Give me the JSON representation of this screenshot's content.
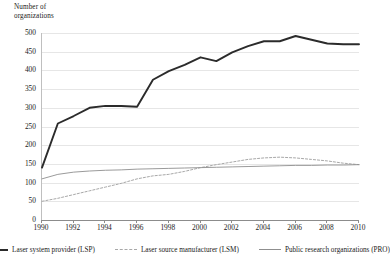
{
  "chart_data": {
    "type": "line",
    "title": "",
    "ylabel": "Number of\norganizations",
    "xlabel": "",
    "ylim": [
      0,
      500
    ],
    "xlim": [
      1990,
      2010
    ],
    "grid": true,
    "legend_position": "bottom",
    "yticks": [
      500,
      450,
      400,
      350,
      300,
      250,
      200,
      150,
      100,
      50,
      0
    ],
    "xticks": [
      1990,
      1992,
      1994,
      1996,
      1998,
      2000,
      2002,
      2004,
      2006,
      2008,
      2010
    ],
    "x": [
      1990,
      1991,
      1992,
      1993,
      1994,
      1995,
      1996,
      1997,
      1998,
      1999,
      2000,
      2001,
      2002,
      2003,
      2004,
      2005,
      2006,
      2007,
      2008,
      2009,
      2010
    ],
    "series": [
      {
        "name": "Laser system provider (LSP)",
        "style": "solid-bold",
        "color": "#2b2b2b",
        "values": [
          140,
          258,
          278,
          300,
          305,
          305,
          303,
          375,
          398,
          415,
          435,
          425,
          448,
          465,
          478,
          478,
          492,
          482,
          472,
          470,
          470
        ]
      },
      {
        "name": "Laser source manufacturer (LSM)",
        "style": "dashed",
        "color": "#a8a8a8",
        "values": [
          50,
          58,
          68,
          78,
          88,
          98,
          110,
          118,
          122,
          130,
          140,
          148,
          155,
          162,
          166,
          168,
          166,
          162,
          158,
          152,
          148
        ]
      },
      {
        "name": "Public research organizations (PRO)",
        "style": "solid-thin",
        "color": "#8f8f8f",
        "values": [
          110,
          122,
          128,
          131,
          133,
          134,
          136,
          137,
          138,
          139,
          140,
          141,
          142,
          143,
          144,
          145,
          146,
          146,
          147,
          147,
          148
        ]
      }
    ]
  },
  "legend": {
    "items": [
      {
        "label": "Laser system provider (LSP)",
        "swatch": "solid-bold-line-icon"
      },
      {
        "label": "Laser source manufacturer (LSM)",
        "swatch": "dashed-line-icon"
      },
      {
        "label": "Public research organizations (PRO)",
        "swatch": "solid-thin-line-icon"
      }
    ]
  },
  "axis": {
    "y_title": "Number of\norganizations"
  }
}
